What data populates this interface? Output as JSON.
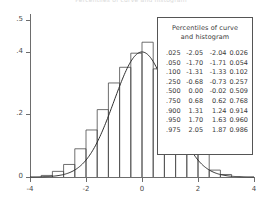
{
  "title": "Percentiles of curve and histogram",
  "legend": {
    "header_line1": "Percentiles of curve",
    "header_line2": "and histogram",
    "rows": [
      {
        "p": ".025",
        "curve_x": "-2.05",
        "hist_x": "-2.04",
        "hist_p": "0.026"
      },
      {
        "p": ".050",
        "curve_x": "-1.70",
        "hist_x": "-1.71",
        "hist_p": "0.054"
      },
      {
        "p": ".100",
        "curve_x": "-1.31",
        "hist_x": "-1.33",
        "hist_p": "0.102"
      },
      {
        "p": ".250",
        "curve_x": "-0.68",
        "hist_x": "-0.73",
        "hist_p": "0.257"
      },
      {
        "p": ".500",
        "curve_x": "0.00",
        "hist_x": "-0.02",
        "hist_p": "0.509"
      },
      {
        "p": ".750",
        "curve_x": "0.68",
        "hist_x": "0.62",
        "hist_p": "0.768"
      },
      {
        "p": ".900",
        "curve_x": "1.31",
        "hist_x": "1.24",
        "hist_p": "0.914"
      },
      {
        "p": ".950",
        "curve_x": "1.70",
        "hist_x": "1.63",
        "hist_p": "0.960"
      },
      {
        "p": ".975",
        "curve_x": "2.05",
        "hist_x": "1.87",
        "hist_p": "0.986"
      }
    ]
  },
  "axes": {
    "y_ticks": [
      "0",
      ".2",
      ".4",
      ".5"
    ],
    "y_tick_values": [
      0,
      0.2,
      0.4,
      0.5
    ],
    "x_ticks": [
      "-4",
      "-2",
      "0",
      "2",
      "4"
    ],
    "x_tick_values": [
      -4,
      -2,
      0,
      2,
      4
    ]
  },
  "chart_data": {
    "type": "bar",
    "title": "Percentiles of curve and histogram",
    "xlabel": "",
    "ylabel": "",
    "xlim": [
      -4,
      4
    ],
    "ylim": [
      0,
      0.52
    ],
    "grid": false,
    "legend_position": "inside-right",
    "bin_width": 0.4,
    "categories": [
      "-3.4",
      "-3.0",
      "-2.6",
      "-2.2",
      "-1.8",
      "-1.4",
      "-1.0",
      "-0.6",
      "-0.2",
      "0.2",
      "0.6",
      "1.0",
      "1.4",
      "1.8",
      "2.2",
      "2.6",
      "3.0"
    ],
    "series": [
      {
        "name": "histogram",
        "type": "bar",
        "values": [
          0.005,
          0.018,
          0.04,
          0.09,
          0.15,
          0.215,
          0.3,
          0.35,
          0.395,
          0.43,
          0.345,
          0.28,
          0.195,
          0.135,
          0.09,
          0.022,
          0.008
        ]
      },
      {
        "name": "normal curve",
        "type": "line",
        "x": [
          -4.0,
          -3.6,
          -3.2,
          -2.8,
          -2.4,
          -2.0,
          -1.6,
          -1.2,
          -0.8,
          -0.4,
          0.0,
          0.4,
          0.8,
          1.2,
          1.6,
          2.0,
          2.4,
          2.8,
          3.2,
          3.6,
          4.0
        ],
        "values": [
          0.0001,
          0.0006,
          0.0024,
          0.0079,
          0.0224,
          0.054,
          0.1109,
          0.1942,
          0.2897,
          0.3683,
          0.3989,
          0.3683,
          0.2897,
          0.1942,
          0.1109,
          0.054,
          0.0224,
          0.0079,
          0.0024,
          0.0006,
          0.0001
        ]
      }
    ]
  },
  "colors": {
    "axis": "#6d6d6d",
    "bar_outline": "#4a4a4a",
    "curve": "#2f2f2f",
    "legend_border": "#555555",
    "text": "#3a3a3a",
    "background": "#ffffff"
  }
}
